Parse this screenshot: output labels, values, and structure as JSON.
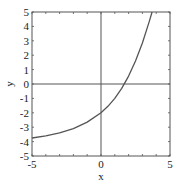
{
  "chart_data": {
    "type": "line",
    "title": "",
    "xlabel": "x",
    "ylabel": "y",
    "xlim": [
      -5,
      5
    ],
    "ylim": [
      -5,
      5
    ],
    "grid": false,
    "legend": null,
    "x_ticks": [
      -5,
      0,
      5
    ],
    "x_tick_labels": [
      "-5",
      "0",
      "5"
    ],
    "y_ticks": [
      -5,
      -4,
      -3,
      -2,
      -1,
      0,
      1,
      2,
      3,
      4,
      5
    ],
    "y_tick_labels": [
      "-5",
      "-4",
      "-3",
      "-2",
      "-1",
      "0",
      "1",
      "2",
      "3",
      "4",
      "5"
    ],
    "minor_ticks_x": [
      -4,
      -3,
      -2,
      -1,
      1,
      2,
      3,
      4
    ],
    "zero_lines": {
      "x0": true,
      "y0": true
    },
    "series": [
      {
        "name": "curve",
        "color": "#555555",
        "x": [
          -5,
          -4,
          -3,
          -2,
          -1,
          0,
          0.5,
          1,
          1.5,
          2,
          2.5,
          3,
          3.5,
          3.7
        ],
        "y": [
          -3.75,
          -3.6,
          -3.4,
          -3.1,
          -2.65,
          -2,
          -1.55,
          -1.0,
          -0.3,
          0.55,
          1.6,
          2.85,
          4.35,
          5
        ]
      }
    ]
  },
  "colors": {
    "frame": "#555555",
    "curve": "#555555",
    "text": "#222222"
  }
}
